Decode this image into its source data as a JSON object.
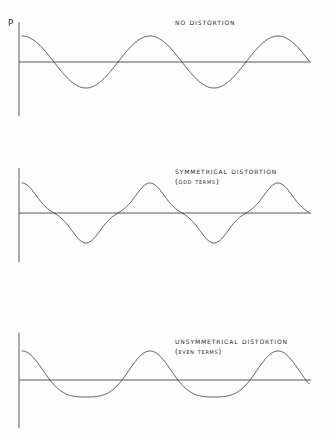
{
  "figure": {
    "background_color": "#fefefe",
    "line_color": "#30302f",
    "axis_color": "#3a3a39",
    "axis_label": "P"
  },
  "panels": [
    {
      "id": "no-distortion",
      "title": "No Distortion",
      "subtitle": "",
      "title_x": 175,
      "title_y": 17,
      "axis": {
        "vertical_x": 19,
        "vertical_top": 22,
        "vertical_bottom": 116,
        "zero_y": 62,
        "x_start": 19,
        "x_end": 311
      },
      "wave": {
        "shape": "pure-sine",
        "amplitude_up": 26,
        "amplitude_down": 26,
        "period": 128,
        "phase_deg": 90,
        "cycles": 2.28
      }
    },
    {
      "id": "symmetrical-distortion",
      "title": "Symmetrical Distortion",
      "subtitle": "(odd terms)",
      "title_x": 175,
      "title_y": 166,
      "axis": {
        "vertical_x": 19,
        "vertical_top": 168,
        "vertical_bottom": 262,
        "zero_y": 213,
        "x_start": 19,
        "x_end": 311
      },
      "wave": {
        "shape": "peaked-triangular",
        "amplitude_up": 30,
        "amplitude_down": 30,
        "period": 128,
        "phase_deg": 90,
        "cycles": 2.28,
        "third_harmonic": -0.17
      }
    },
    {
      "id": "unsymmetrical-distortion",
      "title": "Unsymmetrical Distortion",
      "subtitle": "(even terms)",
      "title_x": 175,
      "title_y": 336,
      "axis": {
        "vertical_x": 19,
        "vertical_top": 333,
        "vertical_bottom": 428,
        "zero_y": 380,
        "x_start": 19,
        "x_end": 311
      },
      "wave": {
        "shape": "asymmetric-even-harmonic",
        "amplitude_up": 29,
        "amplitude_down": 17,
        "period": 128,
        "phase_deg": 90,
        "cycles": 2.28,
        "second_harmonic": 0.22
      }
    }
  ],
  "chart_data": {
    "type": "line",
    "xlabel": "",
    "ylabel": "P",
    "grid": false,
    "legend_position": "none",
    "subplots": 3,
    "series": [
      {
        "name": "No Distortion",
        "description": "Pure sinusoid, cosine phase, no harmonic content",
        "harmonics": [
          {
            "order": 1,
            "amplitude": 1.0
          },
          {
            "order": 2,
            "amplitude": 0.0
          },
          {
            "order": 3,
            "amplitude": 0.0
          }
        ],
        "peak": 1.0,
        "trough": -1.0,
        "cycles_shown": 2.28
      },
      {
        "name": "Symmetrical Distortion (odd terms)",
        "description": "Fundamental plus odd harmonic; peaks and troughs equal, waveform sharpened",
        "harmonics": [
          {
            "order": 1,
            "amplitude": 1.0
          },
          {
            "order": 2,
            "amplitude": 0.0
          },
          {
            "order": 3,
            "amplitude": -0.17
          }
        ],
        "peak": 1.0,
        "trough": -1.0,
        "cycles_shown": 2.28
      },
      {
        "name": "Unsymmetrical Distortion (even terms)",
        "description": "Fundamental plus even harmonic; tall narrow crests, shallow broad troughs",
        "harmonics": [
          {
            "order": 1,
            "amplitude": 1.0
          },
          {
            "order": 2,
            "amplitude": 0.22
          },
          {
            "order": 3,
            "amplitude": 0.0
          }
        ],
        "peak": 1.0,
        "trough": -0.59,
        "cycles_shown": 2.28
      }
    ]
  }
}
